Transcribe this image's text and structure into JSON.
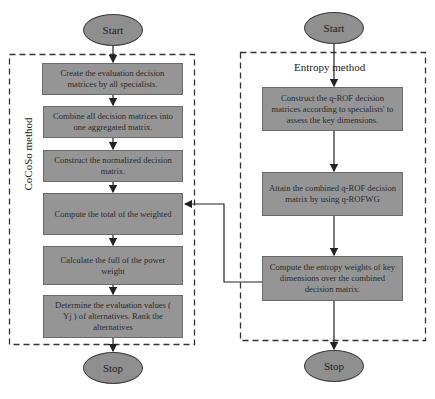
{
  "left_flow": {
    "group_label": "CoCoSo method",
    "start": "Start",
    "stop": "Stop",
    "steps": [
      {
        "text": "Create the evaluation decision matrices by all specialists."
      },
      {
        "text": "Combine all decision matrices into one aggregated matrix."
      },
      {
        "text": "Construct the normalized decision matrix."
      },
      {
        "text": "Compute the total of the weighted"
      },
      {
        "text": "Calculate the full of the power weight"
      },
      {
        "text": "Determine the evaluation values ( Yj ) of alternatives. Rank the alternatives"
      }
    ]
  },
  "right_flow": {
    "group_label": "Entropy method",
    "start": "Start",
    "stop": "Stop",
    "steps": [
      {
        "text": "Construct the q-ROF decision matrices according to specialists' to assess the key dimensions."
      },
      {
        "text": "Attain the combined q-ROF decision matrix by using q-ROFWG"
      },
      {
        "text": "Compute the entropy weights of key dimensions over the combined decision matrix."
      }
    ]
  },
  "connector": {
    "from": "right_flow.steps.2",
    "to": "left_flow.steps.3"
  },
  "colors": {
    "box_fill": "#959595",
    "ellipse_fill": "#8f8f8f",
    "line": "#222222"
  }
}
